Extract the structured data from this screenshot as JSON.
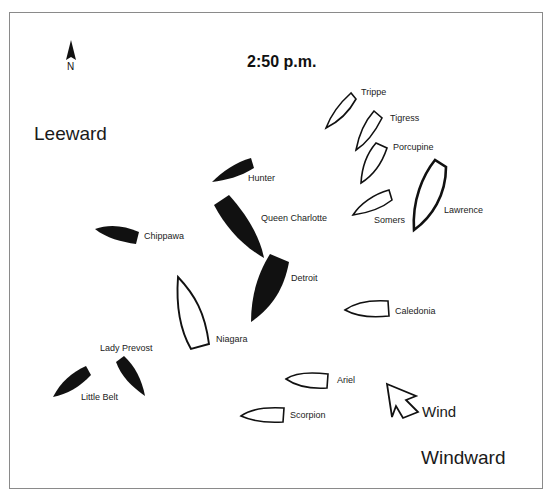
{
  "title": "2:50 p.m.",
  "compass": {
    "label": "N",
    "icon": "north-arrow-icon"
  },
  "regions": {
    "leeward": "Leeward",
    "windward": "Windward"
  },
  "wind": {
    "label": "Wind",
    "icon": "wind-arrow-icon"
  },
  "legend_colors": {
    "british_fleet": "#111111",
    "american_fleet": "#ffffff",
    "outline": "#111111"
  },
  "ships": [
    {
      "name": "Trippe",
      "fleet": "american",
      "fill": "outline"
    },
    {
      "name": "Tigress",
      "fleet": "american",
      "fill": "outline"
    },
    {
      "name": "Porcupine",
      "fleet": "american",
      "fill": "outline"
    },
    {
      "name": "Somers",
      "fleet": "american",
      "fill": "outline"
    },
    {
      "name": "Lawrence",
      "fleet": "american",
      "fill": "outline"
    },
    {
      "name": "Hunter",
      "fleet": "british",
      "fill": "solid"
    },
    {
      "name": "Queen Charlotte",
      "fleet": "british",
      "fill": "solid"
    },
    {
      "name": "Chippawa",
      "fleet": "british",
      "fill": "solid"
    },
    {
      "name": "Detroit",
      "fleet": "british",
      "fill": "solid"
    },
    {
      "name": "Niagara",
      "fleet": "american",
      "fill": "outline"
    },
    {
      "name": "Caledonia",
      "fleet": "american",
      "fill": "outline"
    },
    {
      "name": "Lady Prevost",
      "fleet": "british",
      "fill": "solid"
    },
    {
      "name": "Little Belt",
      "fleet": "british",
      "fill": "solid"
    },
    {
      "name": "Ariel",
      "fleet": "american",
      "fill": "outline"
    },
    {
      "name": "Scorpion",
      "fleet": "american",
      "fill": "outline"
    }
  ]
}
